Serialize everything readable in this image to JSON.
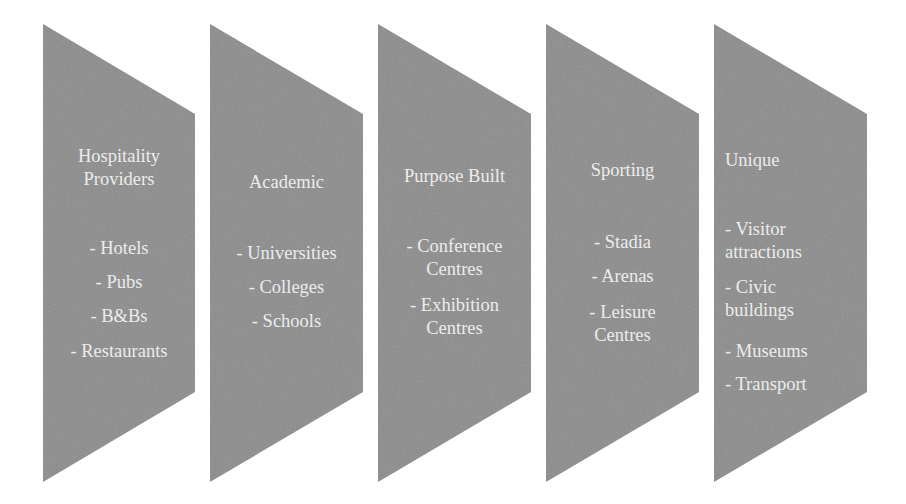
{
  "diagram": {
    "fill_color": "#8c8c8c",
    "text_color": "#ececec",
    "background": "#ffffff",
    "stages": [
      {
        "title_lines": [
          "Hospitality",
          "Providers"
        ],
        "items": [
          [
            "- Hotels"
          ],
          [
            "- Pubs"
          ],
          [
            "- B&Bs"
          ],
          [
            "- Restaurants"
          ]
        ]
      },
      {
        "title_lines": [
          "Academic"
        ],
        "items": [
          [
            "- Universities"
          ],
          [
            "- Colleges"
          ],
          [
            "- Schools"
          ]
        ]
      },
      {
        "title_lines": [
          "Purpose Built"
        ],
        "items": [
          [
            "- Conference",
            "Centres"
          ],
          [
            "- Exhibition",
            "Centres"
          ]
        ]
      },
      {
        "title_lines": [
          "Sporting"
        ],
        "items": [
          [
            "- Stadia"
          ],
          [
            "- Arenas"
          ],
          [
            "- Leisure",
            "Centres"
          ]
        ]
      },
      {
        "title_lines": [
          "Unique"
        ],
        "items": [
          [
            "- Visitor",
            "attractions"
          ],
          [
            "- Civic",
            "buildings"
          ],
          [
            "- Museums"
          ],
          [
            "- Transport"
          ]
        ]
      }
    ]
  }
}
